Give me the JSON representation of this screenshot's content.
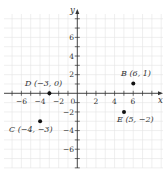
{
  "chart_data": {
    "type": "scatter",
    "title": "",
    "xlabel": "x",
    "ylabel": "y",
    "xlim": [
      -8,
      9
    ],
    "ylim": [
      -8,
      9
    ],
    "grid": true,
    "x_ticks": [
      -6,
      -4,
      -2,
      2,
      4,
      6
    ],
    "y_ticks": [
      6,
      4,
      2,
      -2,
      -4,
      -6
    ],
    "origin_label": "0",
    "points": [
      {
        "name": "B",
        "x": 6,
        "y": 1,
        "label": "B (6, 1)"
      },
      {
        "name": "D",
        "x": -3,
        "y": 0,
        "label": "D (−3, 0)"
      },
      {
        "name": "C",
        "x": -4,
        "y": -3,
        "label": "C (−4, −3)"
      },
      {
        "name": "E",
        "x": 5,
        "y": -2,
        "label": "E (5, −2)"
      }
    ],
    "colors": {
      "axis": "#333333",
      "grid": "#e4e4e4",
      "point": "#111111",
      "text": "#333333"
    }
  },
  "labels": {
    "x_axis": "x",
    "y_axis": "y",
    "origin": "0",
    "x_ticks": [
      "−6",
      "−4",
      "−2",
      "2",
      "4",
      "6"
    ],
    "y_ticks": [
      "6",
      "4",
      "2",
      "−2",
      "−4",
      "−6"
    ],
    "point_B": "B (6, 1)",
    "point_D": "D (−3, 0)",
    "point_C": "C (−4, −3)",
    "point_E": "E (5, −2)"
  }
}
